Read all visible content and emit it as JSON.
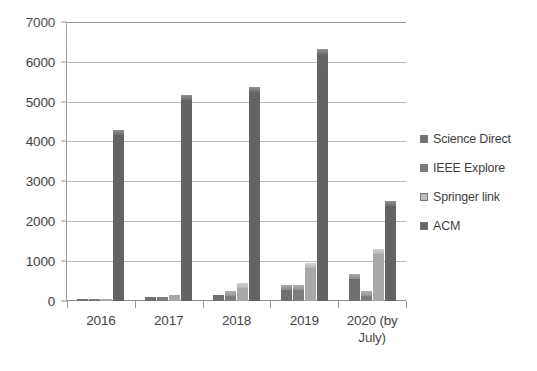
{
  "chart_data": {
    "type": "bar",
    "title": "",
    "xlabel": "",
    "ylabel": "",
    "ylim": [
      0,
      7000
    ],
    "ytick_step": 1000,
    "yticks": [
      "7000",
      "6000",
      "5000",
      "4000",
      "3000",
      "2000",
      "1000",
      "0"
    ],
    "grid": true,
    "legend_position": "right",
    "categories": [
      "2016",
      "2017",
      "2018",
      "2019",
      "2020 (by July)"
    ],
    "category_labels": [
      {
        "line1": "2016",
        "line2": ""
      },
      {
        "line1": "2017",
        "line2": ""
      },
      {
        "line1": "2018",
        "line2": ""
      },
      {
        "line1": "2019",
        "line2": ""
      },
      {
        "line1": "2020 (by",
        "line2": "July)"
      }
    ],
    "series": [
      {
        "name": "Science Direct",
        "color": "#6f6f6f",
        "values": [
          20,
          90,
          150,
          400,
          680
        ]
      },
      {
        "name": "IEEE Explore",
        "color": "#7c7c7c",
        "values": [
          15,
          110,
          250,
          400,
          250
        ]
      },
      {
        "name": "Springer link",
        "color": "#bdbdbd",
        "values": [
          40,
          140,
          450,
          950,
          1320
        ]
      },
      {
        "name": "ACM",
        "color": "#636363",
        "values": [
          4300,
          5200,
          5400,
          6350,
          2530
        ]
      }
    ]
  },
  "legend": {
    "items": [
      {
        "label": "Science Direct"
      },
      {
        "label": "IEEE Explore"
      },
      {
        "label": "Springer link"
      },
      {
        "label": "ACM"
      }
    ]
  }
}
